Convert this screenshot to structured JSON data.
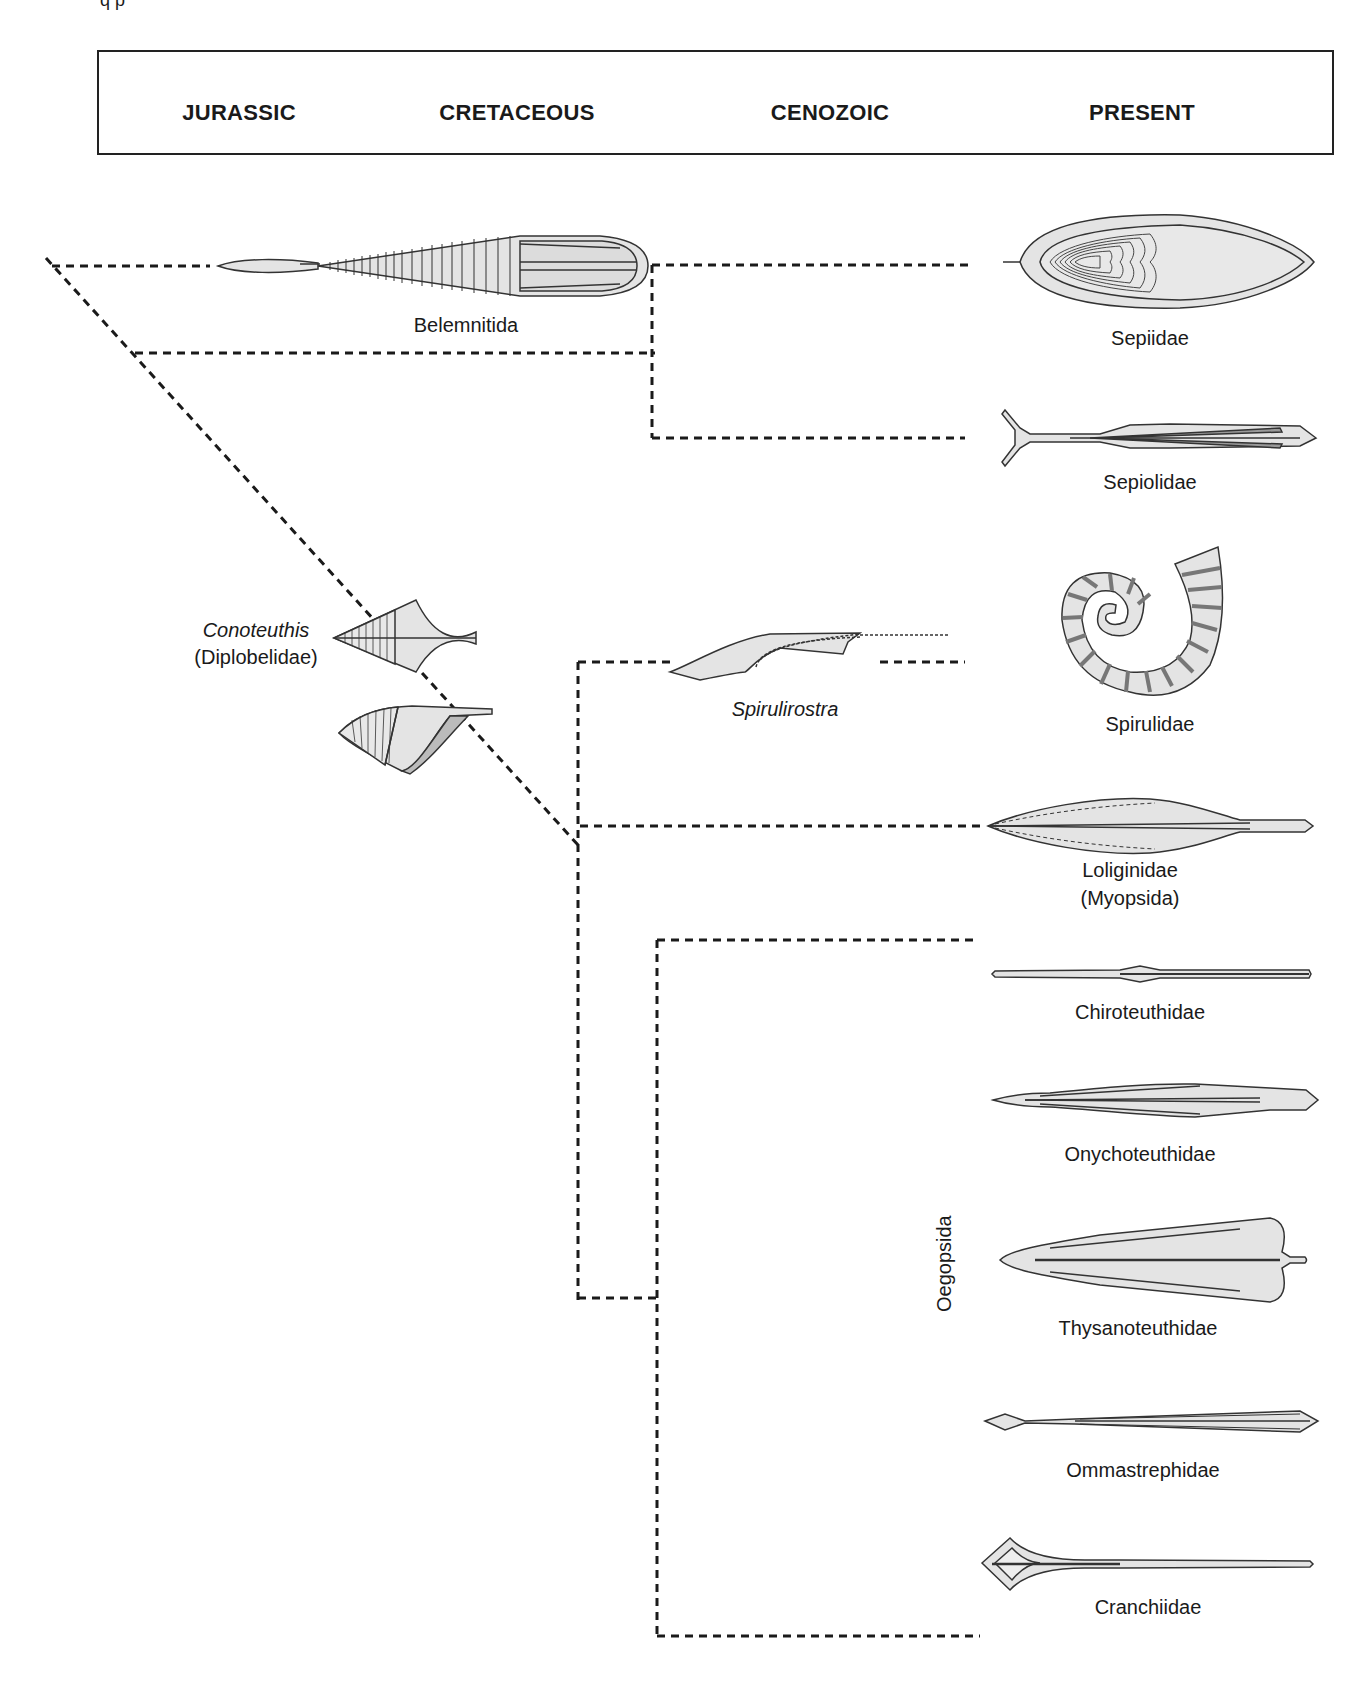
{
  "top_fragment": "q p",
  "periods": [
    {
      "label": "JURASSIC"
    },
    {
      "label": "CRETACEOUS"
    },
    {
      "label": "CENOZOIC"
    },
    {
      "label": "PRESENT"
    }
  ],
  "fossils": {
    "belemnitida": "Belemnitida",
    "conoteuthis": "Conoteuthis",
    "diplobelidae": "(Diplobelidae)",
    "spirulirostra": "Spirulirostra"
  },
  "extant_taxa": [
    {
      "label": "Sepiidae"
    },
    {
      "label": "Sepiolidae"
    },
    {
      "label": "Spirulidae"
    },
    {
      "label": "Loliginidae"
    },
    {
      "label": "Chiroteuthidae"
    },
    {
      "label": "Onychoteuthidae"
    },
    {
      "label": "Thysanoteuthidae"
    },
    {
      "label": "Ommastrephidae"
    },
    {
      "label": "Cranchiidae"
    }
  ],
  "group_labels": {
    "myopsida": "(Myopsida)",
    "oegopsida": "Oegopsida"
  },
  "colors": {
    "line": "#1a1a1a",
    "fill": "#e4e4e4",
    "fill_dark": "#a8a8a8"
  }
}
